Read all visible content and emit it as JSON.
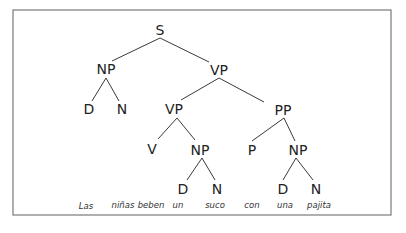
{
  "diagram": {
    "type": "syntax-tree",
    "frame": {
      "x": 13,
      "y": 10,
      "width": 378,
      "height": 205,
      "stroke": "#7a7a7a"
    },
    "nodes": [
      {
        "id": "S",
        "label": "S",
        "x": 160,
        "y": 35
      },
      {
        "id": "NP1",
        "label": "NP",
        "x": 106,
        "y": 74
      },
      {
        "id": "VP1",
        "label": "VP",
        "x": 219,
        "y": 75
      },
      {
        "id": "D1",
        "label": "D",
        "x": 89,
        "y": 114
      },
      {
        "id": "N1",
        "label": "N",
        "x": 122,
        "y": 114
      },
      {
        "id": "VP2",
        "label": "VP",
        "x": 174,
        "y": 114
      },
      {
        "id": "PP",
        "label": "PP",
        "x": 283,
        "y": 115
      },
      {
        "id": "V",
        "label": "V",
        "x": 152,
        "y": 154
      },
      {
        "id": "NP2",
        "label": "NP",
        "x": 200,
        "y": 155
      },
      {
        "id": "P",
        "label": "P",
        "x": 252,
        "y": 155
      },
      {
        "id": "NP3",
        "label": "NP",
        "x": 298,
        "y": 155
      },
      {
        "id": "D2",
        "label": "D",
        "x": 183,
        "y": 194
      },
      {
        "id": "N2",
        "label": "N",
        "x": 217,
        "y": 194
      },
      {
        "id": "D3",
        "label": "D",
        "x": 283,
        "y": 194
      },
      {
        "id": "N3",
        "label": "N",
        "x": 316,
        "y": 194
      }
    ],
    "edges": [
      {
        "from": "S",
        "to": "NP1",
        "x1": 160,
        "y1": 38,
        "x2": 112,
        "y2": 61
      },
      {
        "from": "S",
        "to": "VP1",
        "x1": 160,
        "y1": 38,
        "x2": 209,
        "y2": 62
      },
      {
        "from": "NP1",
        "to": "D1",
        "x1": 106,
        "y1": 78,
        "x2": 92,
        "y2": 101
      },
      {
        "from": "NP1",
        "to": "N1",
        "x1": 106,
        "y1": 78,
        "x2": 119,
        "y2": 101
      },
      {
        "from": "VP1",
        "to": "VP2",
        "x1": 219,
        "y1": 78,
        "x2": 181,
        "y2": 100
      },
      {
        "from": "VP1",
        "to": "PP",
        "x1": 219,
        "y1": 78,
        "x2": 264,
        "y2": 102
      },
      {
        "from": "VP2",
        "to": "V",
        "x1": 177,
        "y1": 118,
        "x2": 158,
        "y2": 139
      },
      {
        "from": "VP2",
        "to": "NP2",
        "x1": 177,
        "y1": 118,
        "x2": 195,
        "y2": 140
      },
      {
        "from": "PP",
        "to": "P",
        "x1": 284,
        "y1": 118,
        "x2": 252,
        "y2": 141
      },
      {
        "from": "PP",
        "to": "NP3",
        "x1": 284,
        "y1": 118,
        "x2": 295,
        "y2": 141
      },
      {
        "from": "NP2",
        "to": "D2",
        "x1": 202,
        "y1": 158,
        "x2": 187,
        "y2": 180
      },
      {
        "from": "NP2",
        "to": "N2",
        "x1": 202,
        "y1": 158,
        "x2": 215,
        "y2": 180
      },
      {
        "from": "NP3",
        "to": "D3",
        "x1": 296,
        "y1": 158,
        "x2": 283,
        "y2": 180
      },
      {
        "from": "NP3",
        "to": "N3",
        "x1": 296,
        "y1": 158,
        "x2": 313,
        "y2": 180
      }
    ],
    "words": [
      {
        "text": "Las",
        "x": 86,
        "y": 209
      },
      {
        "text": "niñas",
        "x": 123,
        "y": 208
      },
      {
        "text": "beben",
        "x": 151,
        "y": 208
      },
      {
        "text": "un",
        "x": 178,
        "y": 208
      },
      {
        "text": "suco",
        "x": 215,
        "y": 208
      },
      {
        "text": "con",
        "x": 252,
        "y": 208
      },
      {
        "text": "una",
        "x": 285,
        "y": 208
      },
      {
        "text": "pajita",
        "x": 319,
        "y": 208
      }
    ]
  }
}
